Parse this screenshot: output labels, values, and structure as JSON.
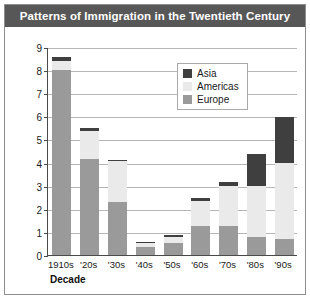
{
  "title": "Patterns of Immigration in the Twentieth Century",
  "colors": {
    "title_bar": "#575757",
    "asia": "#3f3f3f",
    "americas": "#eaeaea",
    "europe": "#9a9a9a",
    "grid": "#b6b6b6",
    "axis": "#4a4a4a"
  },
  "caption": "",
  "chart_data": {
    "type": "bar",
    "stacked": true,
    "title": "Patterns of Immigration in the Twentieth Century",
    "xlabel": "Decade",
    "ylabel": "Immigrants (in millions)",
    "ylim": [
      0,
      9
    ],
    "yticks": [
      0,
      1,
      2,
      3,
      4,
      5,
      6,
      7,
      8,
      9
    ],
    "ytick_labels": [
      "0",
      "1",
      "2",
      "3",
      "4",
      "5",
      "6",
      "7",
      "8",
      "9"
    ],
    "grid": true,
    "legend_position": "top-right",
    "categories": [
      "1910s",
      "'20s",
      "'30s",
      "'40s",
      "'50s",
      "'60s",
      "'70s",
      "'80s",
      "'90s"
    ],
    "series": [
      {
        "name": "Europe",
        "color": "#9a9a9a",
        "values": [
          8.0,
          4.15,
          2.3,
          0.35,
          0.5,
          1.25,
          1.25,
          0.8,
          0.68
        ]
      },
      {
        "name": "Americas",
        "color": "#eaeaea",
        "values": [
          0.4,
          1.2,
          1.75,
          0.15,
          0.3,
          1.1,
          1.75,
          2.2,
          3.3
        ]
      },
      {
        "name": "Asia",
        "color": "#3f3f3f",
        "values": [
          0.15,
          0.15,
          0.05,
          0.05,
          0.08,
          0.1,
          0.15,
          1.35,
          2.0
        ]
      }
    ],
    "totals": [
      8.55,
      5.5,
      4.1,
      0.55,
      0.88,
      2.45,
      3.15,
      4.35,
      5.98
    ]
  }
}
